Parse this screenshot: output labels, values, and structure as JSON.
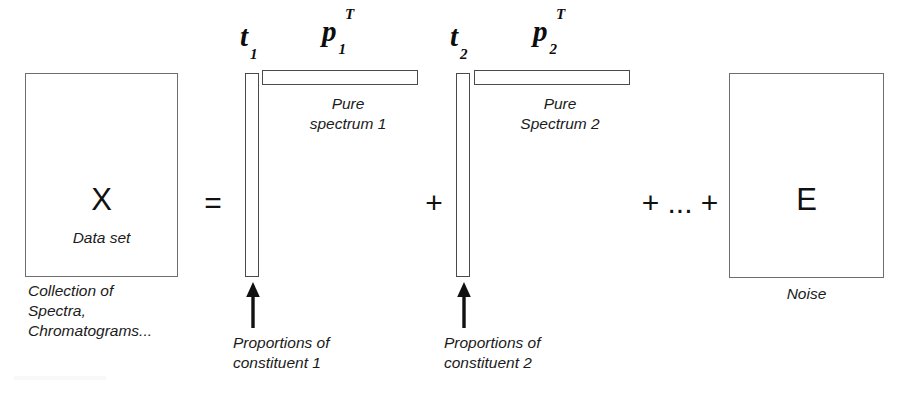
{
  "diagram": {
    "equation": "X = t1 p1^T + t2 p2^T + ... + E",
    "background_color": "#ffffff",
    "line_color": "#4a4a4a"
  },
  "data_matrix": {
    "symbol": "X",
    "caption": "Data set",
    "footnote": "Collection of\nSpectra,\nChromatograms..."
  },
  "operators": {
    "equals": "=",
    "plus": "+",
    "plus_ellipsis_plus": "+ ... +"
  },
  "components": [
    {
      "score_symbol": "t",
      "score_subscript": "1",
      "loading_symbol": "p",
      "loading_subscript": "1",
      "loading_superscript": "T",
      "loading_caption": "Pure\nspectrum 1",
      "score_caption": "Proportions of\nconstituent 1",
      "arrow_name": "score-arrow-1"
    },
    {
      "score_symbol": "t",
      "score_subscript": "2",
      "loading_symbol": "p",
      "loading_subscript": "2",
      "loading_superscript": "T",
      "loading_caption": "Pure\nSpectrum 2",
      "score_caption": "Proportions of\nconstituent 2",
      "arrow_name": "score-arrow-2"
    }
  ],
  "residual": {
    "symbol": "E",
    "caption": "Noise"
  }
}
